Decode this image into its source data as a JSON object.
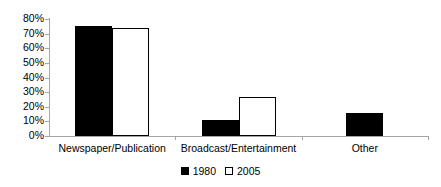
{
  "chart_data": {
    "type": "bar",
    "title": "",
    "subtitle": "",
    "xlabel": "",
    "ylabel": "",
    "categories": [
      "Newspaper/Publication",
      "Broadcast/Entertainment",
      "Other"
    ],
    "series": [
      {
        "name": "1980",
        "values": [
          75,
          11,
          16
        ],
        "color": "#000000",
        "style": "filled"
      },
      {
        "name": "2005",
        "values": [
          74,
          27,
          0
        ],
        "color": "#ffffff",
        "style": "hollow"
      }
    ],
    "ylim": [
      0,
      80
    ],
    "ytick_step": 10,
    "ytick_labels": [
      "0%",
      "10%",
      "20%",
      "30%",
      "40%",
      "50%",
      "60%",
      "70%",
      "80%"
    ],
    "ytick_values": [
      0,
      10,
      20,
      30,
      40,
      50,
      60,
      70,
      80
    ],
    "grid": false,
    "legend_position": "bottom",
    "axis_color": "#a6a6a6",
    "value_format": "percent"
  },
  "legend": {
    "items": [
      {
        "label": "1980"
      },
      {
        "label": "2005"
      }
    ]
  }
}
